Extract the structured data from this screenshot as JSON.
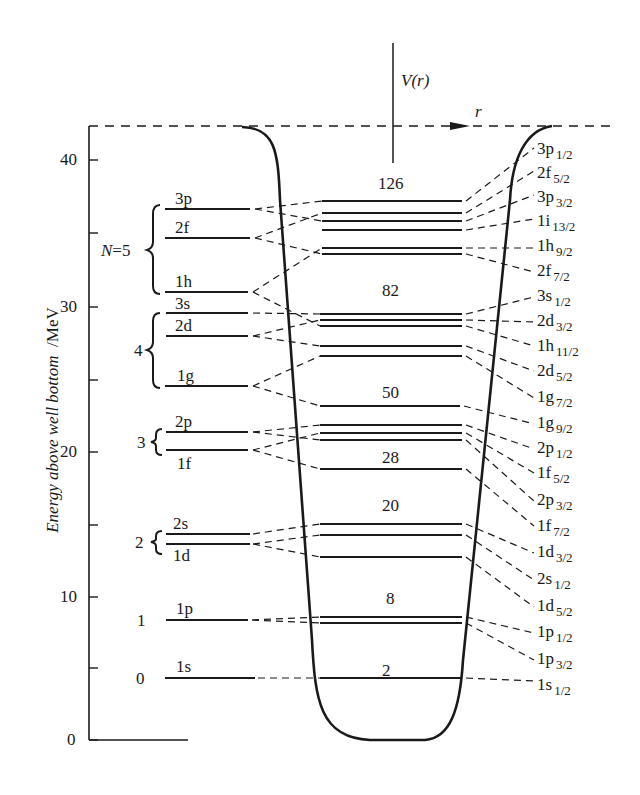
{
  "diagram": {
    "y_axis_label": "Energy above well bottom",
    "y_axis_unit": "/MeV",
    "y_ticks": [
      "0",
      "10",
      "20",
      "30",
      "40"
    ],
    "potential_label": "V(r)",
    "r_label": "r",
    "oscillator_shells": [
      {
        "N": "0",
        "label": "0",
        "levels": [
          "1s"
        ]
      },
      {
        "N": "1",
        "label": "1",
        "levels": [
          "1p"
        ]
      },
      {
        "N": "2",
        "label": "2",
        "levels": [
          "2s",
          "1d"
        ]
      },
      {
        "N": "3",
        "label": "3",
        "levels": [
          "2p",
          "1f"
        ]
      },
      {
        "N": "4",
        "label": "4",
        "levels": [
          "3s",
          "2d",
          "1g"
        ]
      },
      {
        "N": "5",
        "label": "N = 5",
        "levels": [
          "3p",
          "2f",
          "1h"
        ]
      }
    ],
    "left_levels": [
      {
        "name": "3p",
        "energy": 36.5
      },
      {
        "name": "2f",
        "energy": 34.5
      },
      {
        "name": "1h",
        "energy": 30.9
      },
      {
        "name": "3s",
        "energy": 29.4
      },
      {
        "name": "2d",
        "energy": 27.8
      },
      {
        "name": "1g",
        "energy": 24.4
      },
      {
        "name": "2p",
        "energy": 21.2
      },
      {
        "name": "1f",
        "energy": 20.0
      },
      {
        "name": "2s",
        "energy": 14.2
      },
      {
        "name": "1d",
        "energy": 13.5
      },
      {
        "name": "1p",
        "energy": 8.3
      },
      {
        "name": "1s",
        "energy": 4.3
      }
    ],
    "magic_numbers": [
      "2",
      "8",
      "20",
      "28",
      "50",
      "82",
      "126"
    ],
    "right_levels": [
      {
        "orb": "3p",
        "j": "1/2"
      },
      {
        "orb": "2f",
        "j": "5/2"
      },
      {
        "orb": "3p",
        "j": "3/2"
      },
      {
        "orb": "1i",
        "j": "13/2"
      },
      {
        "orb": "1h",
        "j": "9/2"
      },
      {
        "orb": "2f",
        "j": "7/2"
      },
      {
        "orb": "3s",
        "j": "1/2"
      },
      {
        "orb": "2d",
        "j": "3/2"
      },
      {
        "orb": "1h",
        "j": "11/2"
      },
      {
        "orb": "2d",
        "j": "5/2"
      },
      {
        "orb": "1g",
        "j": "7/2"
      },
      {
        "orb": "1g",
        "j": "9/2"
      },
      {
        "orb": "2p",
        "j": "1/2"
      },
      {
        "orb": "1f",
        "j": "5/2"
      },
      {
        "orb": "2p",
        "j": "3/2"
      },
      {
        "orb": "1f",
        "j": "7/2"
      },
      {
        "orb": "1d",
        "j": "3/2"
      },
      {
        "orb": "2s",
        "j": "1/2"
      },
      {
        "orb": "1d",
        "j": "5/2"
      },
      {
        "orb": "1p",
        "j": "1/2"
      },
      {
        "orb": "1p",
        "j": "3/2"
      },
      {
        "orb": "1s",
        "j": "1/2"
      }
    ]
  }
}
